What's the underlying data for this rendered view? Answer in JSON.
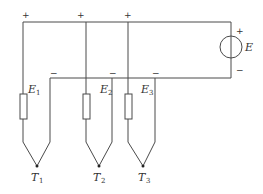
{
  "diagram": {
    "type": "circuit",
    "source": {
      "label": "E",
      "plus": "+",
      "minus": "−"
    },
    "top_terminals": [
      "+",
      "+",
      "+"
    ],
    "bottom_terminals": [
      "−",
      "−",
      "−"
    ],
    "thermocouples": [
      {
        "emf_label": "E",
        "emf_sub": "1",
        "junction_label": "T",
        "junction_sub": "1"
      },
      {
        "emf_label": "E",
        "emf_sub": "2",
        "junction_label": "T",
        "junction_sub": "2"
      },
      {
        "emf_label": "E",
        "emf_sub": "3",
        "junction_label": "T",
        "junction_sub": "3"
      }
    ]
  }
}
